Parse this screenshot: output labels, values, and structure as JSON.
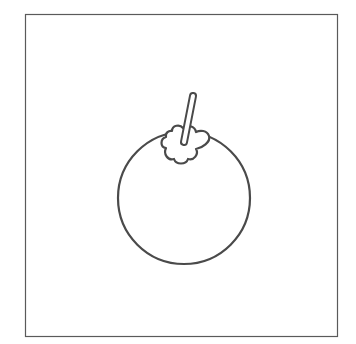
{
  "illustration": {
    "subject": "fruit outline (tomato/mangosteen-like) with stem and calyx",
    "stroke_color": "#4a4a4a",
    "background_color": "#ffffff",
    "frame": {
      "x": 25,
      "y": 14,
      "width": 313,
      "height": 323,
      "stroke_color": "#5a5a5a"
    },
    "fruit_body": {
      "cx": 184,
      "cy": 198,
      "r": 66
    },
    "stem": {
      "x1": 193,
      "y1": 96,
      "x2": 184,
      "y2": 142,
      "width": 7
    },
    "calyx": {
      "cx": 185,
      "cy": 145,
      "lobes": 5
    }
  }
}
